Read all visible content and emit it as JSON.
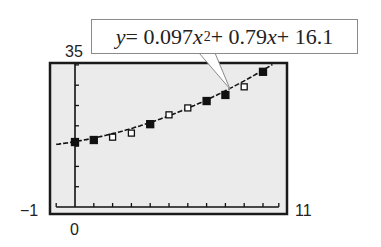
{
  "chart_data": {
    "type": "scatter",
    "title": "",
    "equation": "y = 0.097x^2 + 0.79x + 16.1",
    "model": {
      "a": 0.097,
      "b": 0.79,
      "c": 16.1
    },
    "xlabel": "",
    "ylabel": "",
    "xlim": [
      -1,
      11
    ],
    "ylim": [
      0,
      35
    ],
    "x_tick_step": 1,
    "y_tick_step": 5,
    "grid": false,
    "legend": "none",
    "window_labels": {
      "xmin": "−1",
      "xmax": "11",
      "ymin": "0",
      "ymax": "35"
    },
    "series": [
      {
        "name": "data points",
        "x": [
          0,
          1,
          2,
          3,
          4,
          5,
          6,
          7,
          8,
          9,
          10
        ],
        "y": [
          16.0,
          16.5,
          17.2,
          18.2,
          20.4,
          22.7,
          24.4,
          26.1,
          27.6,
          29.6,
          33.3
        ],
        "marker_filled": [
          true,
          true,
          false,
          false,
          true,
          false,
          false,
          true,
          true,
          false,
          true
        ]
      },
      {
        "name": "quadratic regression curve",
        "type": "line",
        "x_range": [
          -1,
          10.5
        ]
      }
    ]
  },
  "labels": {
    "ymax": "35",
    "xmin": "−1",
    "xmax": "11",
    "ymin": "0"
  },
  "callout": {
    "y": "y",
    "eq_part1": " = 0.097",
    "x1": "x",
    "exp": "2",
    "eq_part2": " + 0.79",
    "x2": "x",
    "eq_part3": " + 16.1"
  },
  "colors": {
    "screen_bg": "#ebebeb",
    "frame": "#1a1a1a",
    "ink": "#111111",
    "hollow_fill": "#ffffff"
  }
}
